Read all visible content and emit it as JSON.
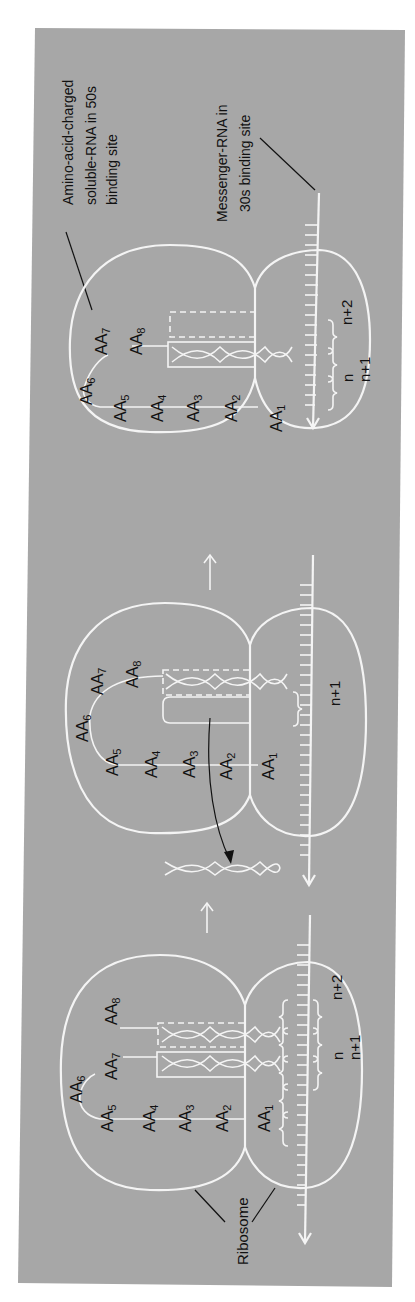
{
  "figure": {
    "orientation": "rotated-90-ccw",
    "background_color": "#a7a7a7",
    "line_color": "#f4f4f4",
    "text_color": "#111111",
    "annotations": {
      "trna_label_line1": "Amino-acid-charged",
      "trna_label_line2": "soluble-RNA in 50s",
      "trna_label_line3": "binding site",
      "mrna_label_line1": "Messenger-RNA in",
      "mrna_label_line2": "30s binding site",
      "ribosome_label": "Ribosome"
    },
    "stages": [
      {
        "name": "stage-1",
        "amino_acids": [
          "AA",
          "AA",
          "AA",
          "AA",
          "AA",
          "AA",
          "AA",
          "AA"
        ],
        "amino_acid_indices": [
          "1",
          "2",
          "3",
          "4",
          "5",
          "6",
          "7",
          "8"
        ],
        "codon_labels": [
          "n",
          "n+1",
          "n+2"
        ]
      },
      {
        "name": "stage-2",
        "amino_acids": [
          "AA",
          "AA",
          "AA",
          "AA",
          "AA",
          "AA",
          "AA",
          "AA"
        ],
        "amino_acid_indices": [
          "1",
          "2",
          "3",
          "4",
          "5",
          "6",
          "7",
          "8"
        ],
        "codon_labels": [
          "n+1"
        ]
      },
      {
        "name": "stage-3",
        "amino_acids": [
          "AA",
          "AA",
          "AA",
          "AA",
          "AA",
          "AA",
          "AA",
          "AA"
        ],
        "amino_acid_indices": [
          "1",
          "2",
          "3",
          "4",
          "5",
          "6",
          "7",
          "8"
        ],
        "codon_labels": [
          "n",
          "n+1",
          "n+2"
        ]
      }
    ]
  }
}
